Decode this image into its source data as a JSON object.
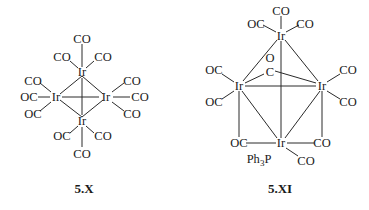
{
  "figure": {
    "structures": [
      {
        "caption": "5.X",
        "metal_atoms": [
          "Ir",
          "Ir",
          "Ir",
          "Ir"
        ],
        "ligands": {
          "top_ir": [
            "CO",
            "CO",
            "CO"
          ],
          "left_ir": [
            "CO",
            "OC",
            "OC"
          ],
          "right_ir": [
            "CO",
            "CO",
            "CO"
          ],
          "bottom_ir": [
            "OC",
            "CO",
            "CO"
          ]
        },
        "labels": {
          "ir_top": "Ir",
          "ir_left": "Ir",
          "ir_right": "Ir",
          "ir_bottom": "Ir",
          "t1": "CO",
          "t2": "CO",
          "t3": "CO",
          "l1": "CO",
          "l2": "OC",
          "l3": "OC",
          "r1": "CO",
          "r2": "CO",
          "r3": "CO",
          "b1": "OC",
          "b2": "CO",
          "b3": "CO"
        }
      },
      {
        "caption": "5.XI",
        "metal_atoms": [
          "Ir",
          "Ir",
          "Ir",
          "Ir"
        ],
        "labels": {
          "ir_top": "Ir",
          "ir_left": "Ir",
          "ir_right": "Ir",
          "ir_bottom": "Ir",
          "t1": "CO",
          "t2": "OC",
          "t3": "CO",
          "bridge_o": "O",
          "bridge_c": "C",
          "l1": "OC",
          "l2": "OC",
          "r1": "CO",
          "r2": "CO",
          "bl": "OC",
          "br": "CO",
          "bco": "CO",
          "pph3": "Ph3P"
        }
      }
    ]
  }
}
